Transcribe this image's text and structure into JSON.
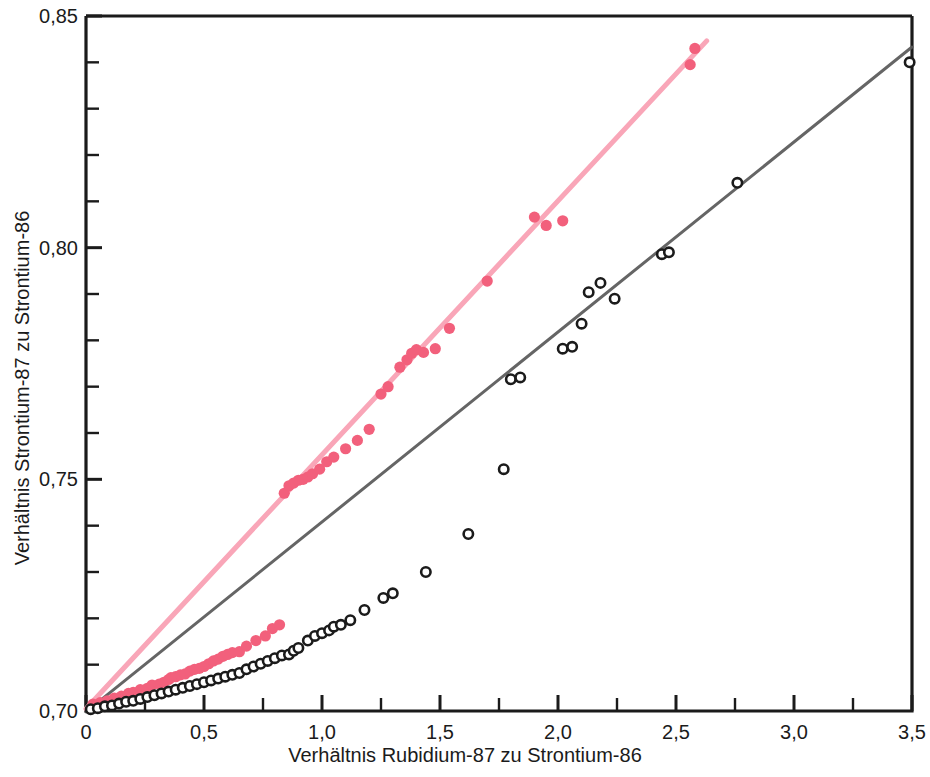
{
  "chart_data": {
    "type": "scatter",
    "title": "",
    "xlabel": "Verhältnis Rubidium-87 zu Strontium-86",
    "ylabel": "Verhältnis Strontium-87 zu Strontium-86",
    "xlim": [
      0,
      3.5
    ],
    "ylim": [
      0.7,
      0.85
    ],
    "xticks": [
      0,
      0.5,
      1.0,
      1.5,
      2.0,
      2.5,
      3.0,
      3.5
    ],
    "xticklabels": [
      "0",
      "0,5",
      "1,0",
      "1,5",
      "2,0",
      "2,5",
      "3,0",
      "3,5"
    ],
    "xminor_step": 0.25,
    "yticks": [
      0.7,
      0.75,
      0.8,
      0.85
    ],
    "yticklabels": [
      "0,70",
      "0,75",
      "0,80",
      "0,85"
    ],
    "yminor_step": 0.01,
    "grid": false,
    "legend": "none",
    "series": [
      {
        "name": "pink-isochron",
        "marker": "filled-circle",
        "color": "#F2607C",
        "line_color": "#F9A6B8",
        "fit_line": {
          "intercept": 0.7005,
          "slope": 0.0548,
          "x_start": 0.0,
          "x_end": 2.63
        },
        "points": [
          [
            0.03,
            0.7015
          ],
          [
            0.06,
            0.7018
          ],
          [
            0.09,
            0.7022
          ],
          [
            0.12,
            0.7028
          ],
          [
            0.15,
            0.7032
          ],
          [
            0.18,
            0.7038
          ],
          [
            0.2,
            0.704
          ],
          [
            0.23,
            0.7046
          ],
          [
            0.26,
            0.7049
          ],
          [
            0.28,
            0.7056
          ],
          [
            0.31,
            0.7058
          ],
          [
            0.33,
            0.7062
          ],
          [
            0.35,
            0.7068
          ],
          [
            0.36,
            0.7072
          ],
          [
            0.38,
            0.7074
          ],
          [
            0.4,
            0.7078
          ],
          [
            0.42,
            0.708
          ],
          [
            0.44,
            0.7086
          ],
          [
            0.46,
            0.709
          ],
          [
            0.48,
            0.7092
          ],
          [
            0.5,
            0.7096
          ],
          [
            0.52,
            0.7102
          ],
          [
            0.54,
            0.7108
          ],
          [
            0.56,
            0.7112
          ],
          [
            0.58,
            0.7118
          ],
          [
            0.6,
            0.7122
          ],
          [
            0.62,
            0.7126
          ],
          [
            0.65,
            0.7128
          ],
          [
            0.68,
            0.714
          ],
          [
            0.72,
            0.7152
          ],
          [
            0.76,
            0.7162
          ],
          [
            0.79,
            0.7178
          ],
          [
            0.82,
            0.7186
          ],
          [
            0.84,
            0.747
          ],
          [
            0.86,
            0.7486
          ],
          [
            0.88,
            0.7492
          ],
          [
            0.9,
            0.7498
          ],
          [
            0.92,
            0.75
          ],
          [
            0.94,
            0.7505
          ],
          [
            0.96,
            0.7512
          ],
          [
            0.99,
            0.7522
          ],
          [
            1.02,
            0.7538
          ],
          [
            1.05,
            0.7548
          ],
          [
            1.1,
            0.7566
          ],
          [
            1.15,
            0.7584
          ],
          [
            1.2,
            0.7608
          ],
          [
            1.25,
            0.7684
          ],
          [
            1.28,
            0.77
          ],
          [
            1.33,
            0.7742
          ],
          [
            1.36,
            0.7758
          ],
          [
            1.38,
            0.7772
          ],
          [
            1.4,
            0.778
          ],
          [
            1.43,
            0.7774
          ],
          [
            1.48,
            0.7782
          ],
          [
            1.54,
            0.7826
          ],
          [
            1.7,
            0.7928
          ],
          [
            1.9,
            0.8066
          ],
          [
            1.95,
            0.8048
          ],
          [
            2.02,
            0.8058
          ],
          [
            2.56,
            0.8395
          ],
          [
            2.58,
            0.843
          ]
        ]
      },
      {
        "name": "black-isochron",
        "marker": "open-circle",
        "color": "#1b1b1b",
        "line_color": "#595959",
        "fit_line": {
          "intercept": 0.6998,
          "slope": 0.041,
          "x_start": 0.0,
          "x_end": 3.5
        },
        "points": [
          [
            0.02,
            0.7004
          ],
          [
            0.05,
            0.7006
          ],
          [
            0.08,
            0.701
          ],
          [
            0.11,
            0.7012
          ],
          [
            0.14,
            0.7016
          ],
          [
            0.17,
            0.702
          ],
          [
            0.2,
            0.7022
          ],
          [
            0.23,
            0.7026
          ],
          [
            0.26,
            0.703
          ],
          [
            0.29,
            0.7034
          ],
          [
            0.32,
            0.7038
          ],
          [
            0.35,
            0.7042
          ],
          [
            0.38,
            0.7046
          ],
          [
            0.41,
            0.705
          ],
          [
            0.44,
            0.7054
          ],
          [
            0.47,
            0.7058
          ],
          [
            0.5,
            0.7062
          ],
          [
            0.53,
            0.7066
          ],
          [
            0.56,
            0.707
          ],
          [
            0.59,
            0.7074
          ],
          [
            0.62,
            0.7078
          ],
          [
            0.65,
            0.7082
          ],
          [
            0.68,
            0.709
          ],
          [
            0.71,
            0.7096
          ],
          [
            0.74,
            0.7102
          ],
          [
            0.77,
            0.7108
          ],
          [
            0.8,
            0.7114
          ],
          [
            0.83,
            0.712
          ],
          [
            0.86,
            0.7122
          ],
          [
            0.88,
            0.713
          ],
          [
            0.9,
            0.7136
          ],
          [
            0.94,
            0.7152
          ],
          [
            0.97,
            0.7162
          ],
          [
            1.0,
            0.7168
          ],
          [
            1.03,
            0.7174
          ],
          [
            1.05,
            0.7182
          ],
          [
            1.08,
            0.7186
          ],
          [
            1.12,
            0.7196
          ],
          [
            1.18,
            0.7218
          ],
          [
            1.26,
            0.7244
          ],
          [
            1.3,
            0.7254
          ],
          [
            1.44,
            0.73
          ],
          [
            1.62,
            0.7382
          ],
          [
            1.77,
            0.7522
          ],
          [
            1.8,
            0.7716
          ],
          [
            1.84,
            0.772
          ],
          [
            2.02,
            0.7782
          ],
          [
            2.06,
            0.7786
          ],
          [
            2.1,
            0.7836
          ],
          [
            2.13,
            0.7904
          ],
          [
            2.18,
            0.7924
          ],
          [
            2.24,
            0.789
          ],
          [
            2.44,
            0.7986
          ],
          [
            2.47,
            0.799
          ],
          [
            2.76,
            0.814
          ],
          [
            3.49,
            0.84
          ]
        ]
      }
    ]
  },
  "axes": {
    "x_title": "Verhältnis Rubidium-87 zu Strontium-86",
    "y_title": "Verhältnis Strontium-87 zu Strontium-86",
    "x_labels": [
      "0",
      "0,5",
      "1,0",
      "1,5",
      "2,0",
      "2,5",
      "3,0",
      "3,5"
    ],
    "y_labels": [
      "0,85",
      "0,80",
      "0,75",
      "0,70"
    ]
  },
  "colors": {
    "pink_marker": "#F2607C",
    "pink_line": "#F9A6B8",
    "black_marker": "#1b1b1b",
    "black_line": "#595959",
    "axis": "#1b1b1b",
    "background": "#ffffff"
  }
}
